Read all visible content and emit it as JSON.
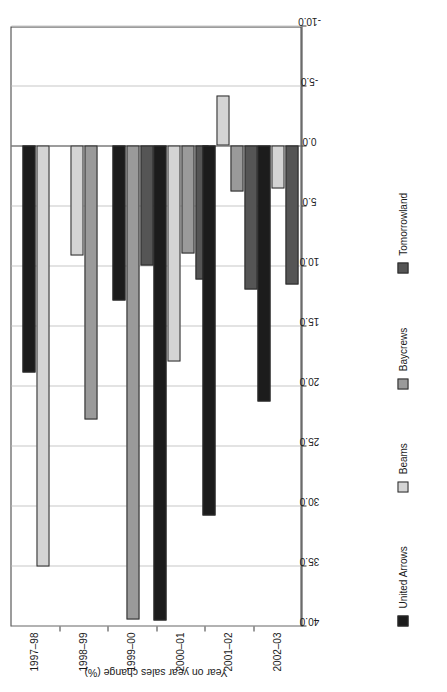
{
  "chart_data": {
    "type": "bar",
    "title": "",
    "orientation": "vertical-bars-grouped",
    "xlabel": "",
    "ylabel": "Year on year sales change (%)",
    "categories": [
      "1997–98",
      "1998–99",
      "1999–00",
      "2000–01",
      "2001–02",
      "2002–03"
    ],
    "ylim": [
      -10.0,
      40.0
    ],
    "ytick_labels": [
      "40.0",
      "35.0",
      "30.0",
      "25.0",
      "20.0",
      "15.0",
      "10.0",
      "5.0",
      "0.0",
      "-5.0",
      "-10.0"
    ],
    "ytick_values": [
      40.0,
      35.0,
      30.0,
      25.0,
      20.0,
      15.0,
      10.0,
      5.0,
      0.0,
      -5.0,
      -10.0
    ],
    "grid": true,
    "legend_position": "bottom",
    "series": [
      {
        "name": "United Arrows",
        "color": "#1c1c1c",
        "values": [
          18.9,
          null,
          12.9,
          39.6,
          30.8,
          21.3
        ]
      },
      {
        "name": "Beams",
        "color": "#d4d4d4",
        "values": [
          35.1,
          9.2,
          null,
          18.0,
          -4.2,
          3.6
        ]
      },
      {
        "name": "Baycrews",
        "color": "#9a9a9a",
        "values": [
          null,
          22.8,
          39.5,
          9.0,
          3.8,
          null
        ]
      },
      {
        "name": "Tomorrowland",
        "color": "#555555",
        "values": [
          null,
          null,
          10.0,
          11.2,
          12.0,
          11.6
        ]
      }
    ]
  },
  "axis": {
    "value_axis_title": "Year on year sales change (%)"
  }
}
